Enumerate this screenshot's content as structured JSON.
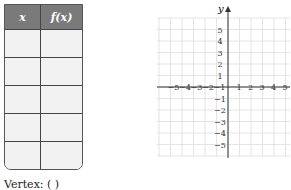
{
  "table": {
    "headers": [
      "x",
      "f(x)"
    ],
    "rows": [
      [
        "",
        ""
      ],
      [
        "",
        ""
      ],
      [
        "",
        ""
      ],
      [
        "",
        ""
      ],
      [
        "",
        ""
      ]
    ]
  },
  "vertex_label": "Vertex: (                )",
  "graph": {
    "y_label": "y",
    "x_ticks": [
      "−5",
      "−4",
      "−3",
      "−2",
      "−1",
      "1",
      "2",
      "3",
      "4",
      "5"
    ],
    "y_ticks": [
      "5",
      "4",
      "3",
      "2",
      "1",
      "−1",
      "−2",
      "−3",
      "−4",
      "−5"
    ]
  }
}
